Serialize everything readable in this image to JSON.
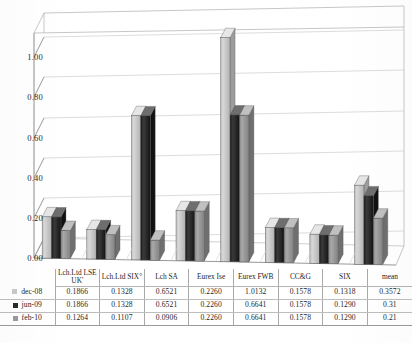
{
  "chart_data": {
    "type": "bar",
    "title": "",
    "subtitle": "",
    "xlabel": "",
    "ylabel": "",
    "ylim": [
      0.0,
      1.0
    ],
    "y_ticks": [
      "0.00",
      "0.20",
      "0.40",
      "0.60",
      "0.80",
      "1.00"
    ],
    "y_tick_values": [
      0.0,
      0.2,
      0.4,
      0.6,
      0.8,
      1.0
    ],
    "grid": true,
    "three_d": true,
    "legend_position": "table-left",
    "categories": [
      "Lch.Ltd LSE UK'",
      "Lch.Ltd SIX°",
      "Lch SA",
      "Eurex Ise",
      "Eurex FWB",
      "CC&G",
      "SIX",
      "mean"
    ],
    "series": [
      {
        "name": "dec-08",
        "color": "#c9c9c9",
        "values": [
          0.1866,
          0.1328,
          0.6521,
          0.226,
          1.0132,
          0.1578,
          0.1318,
          0.3572
        ],
        "labels": [
          "0.1866",
          "0.1328",
          "0.6521",
          "0.2260",
          "1.0132",
          "0.1578",
          "0.1318",
          "0.3572"
        ]
      },
      {
        "name": "jun-09",
        "color": "#2b2b2b",
        "values": [
          0.1866,
          0.1328,
          0.6521,
          0.226,
          0.6641,
          0.1578,
          0.129,
          0.31
        ],
        "labels": [
          "0.1866",
          "0.1328",
          "0.6521",
          "0.2260",
          "0.6641",
          "0.1578",
          "0.1290",
          "0.31"
        ]
      },
      {
        "name": "feb-10",
        "color": "#9a9a9a",
        "values": [
          0.1264,
          0.1107,
          0.0906,
          0.226,
          0.6641,
          0.1578,
          0.129,
          0.21
        ],
        "labels": [
          "0.1264",
          "0.1107",
          "0.0906",
          "0.2260",
          "0.6641",
          "0.1578",
          "0.1290",
          "0.21"
        ]
      }
    ]
  },
  "table": {
    "header_legend_label": "",
    "columns": [
      "Lch.Ltd LSE UK'",
      "Lch.Ltd SIX°",
      "Lch SA",
      "Eurex Ise",
      "Eurex FWB",
      "CC&G",
      "SIX",
      "mean"
    ],
    "rows": [
      {
        "label": "dec-08",
        "swatch": "#c9c9c9",
        "values": [
          "0.1866",
          "0.1328",
          "0.6521",
          "0.2260",
          "1.0132",
          "0.1578",
          "0.1318",
          "0.3572"
        ]
      },
      {
        "label": "jun-09",
        "swatch": "#2b2b2b",
        "values": [
          "0.1866",
          "0.1328",
          "0.6521",
          "0.2260",
          "0.6641",
          "0.1578",
          "0.1290",
          "0.31"
        ]
      },
      {
        "label": "feb-10",
        "swatch": "#9a9a9a",
        "values": [
          "0.1264",
          "0.1107",
          "0.0906",
          "0.2260",
          "0.6641",
          "0.1578",
          "0.1290",
          "0.21"
        ]
      }
    ]
  },
  "style": {
    "series_colors": [
      "#c9c9c9",
      "#2b2b2b",
      "#9a9a9a"
    ],
    "axis_color": "#8c8c8c",
    "grid_color": "#c6c6c6",
    "floor_color": "#ffffff",
    "text_color": "#2a2a2a"
  }
}
